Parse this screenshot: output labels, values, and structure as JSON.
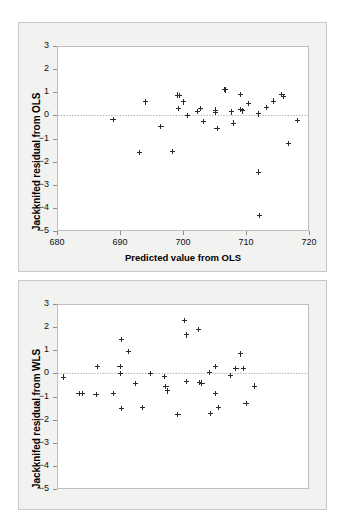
{
  "figure": {
    "background": "#ffffff",
    "panel_bg": "#f2f2f0",
    "marker_color": "#2a2a2a",
    "zero_line_color": "#9a9a9a"
  },
  "panels": [
    {
      "id": "ols",
      "ylabel": "Jackknifed residual from OLS",
      "xlabel": "Predicted value from OLS",
      "show_xaxis": true
    },
    {
      "id": "wls",
      "ylabel": "Jackknifed residual from WLS",
      "xlabel": "",
      "show_xaxis": false
    }
  ],
  "chart_data": [
    {
      "type": "scatter",
      "title": "",
      "xlabel": "Predicted value from OLS",
      "ylabel": "Jackknifed residual from OLS",
      "xlim": [
        680,
        720
      ],
      "ylim": [
        -5,
        3
      ],
      "xticks": [
        680,
        690,
        700,
        710,
        720
      ],
      "yticks": [
        3,
        2,
        1,
        0,
        -1,
        -2,
        -3,
        -4,
        -5
      ],
      "xtick_labels": [
        "680",
        "690",
        "700",
        "710",
        "720"
      ],
      "ytick_labels": [
        "3",
        "2",
        "1",
        "0",
        "−1",
        "−2",
        "−3",
        "−4",
        "−5"
      ],
      "grid": false,
      "legend": "none",
      "annotations": [
        {
          "type": "hline",
          "y": 0,
          "style": "dotted"
        }
      ],
      "marker": "plus",
      "points": [
        {
          "x": 688.9,
          "y": -0.17
        },
        {
          "x": 693.1,
          "y": -1.62
        },
        {
          "x": 694.1,
          "y": 0.58
        },
        {
          "x": 696.5,
          "y": -0.49
        },
        {
          "x": 698.3,
          "y": -1.57
        },
        {
          "x": 699.2,
          "y": 0.88
        },
        {
          "x": 699.5,
          "y": 0.85
        },
        {
          "x": 699.3,
          "y": 0.31
        },
        {
          "x": 700.1,
          "y": 0.58
        },
        {
          "x": 700.7,
          "y": 0.01
        },
        {
          "x": 702.3,
          "y": 0.16
        },
        {
          "x": 702.8,
          "y": 0.3
        },
        {
          "x": 703.2,
          "y": -0.25
        },
        {
          "x": 705.1,
          "y": 0.23
        },
        {
          "x": 705.2,
          "y": 0.12
        },
        {
          "x": 705.4,
          "y": -0.57
        },
        {
          "x": 706.6,
          "y": 1.11
        },
        {
          "x": 706.8,
          "y": 1.1
        },
        {
          "x": 707.7,
          "y": 0.15
        },
        {
          "x": 708.0,
          "y": -0.33
        },
        {
          "x": 709.1,
          "y": 0.92
        },
        {
          "x": 709.2,
          "y": 0.27
        },
        {
          "x": 709.5,
          "y": 0.19
        },
        {
          "x": 710.4,
          "y": 0.53
        },
        {
          "x": 712.0,
          "y": 0.06
        },
        {
          "x": 712.0,
          "y": -2.45
        },
        {
          "x": 712.2,
          "y": -4.33
        },
        {
          "x": 713.2,
          "y": 0.35
        },
        {
          "x": 714.4,
          "y": 0.62
        },
        {
          "x": 715.7,
          "y": 0.89
        },
        {
          "x": 716.0,
          "y": 0.83
        },
        {
          "x": 716.7,
          "y": -1.2
        },
        {
          "x": 718.2,
          "y": -0.22
        }
      ]
    },
    {
      "type": "scatter",
      "title": "",
      "xlabel": "",
      "ylabel": "Jackknifed residual from WLS",
      "xlim": [
        680,
        720
      ],
      "ylim": [
        -5,
        3
      ],
      "xticks": [],
      "yticks": [
        3,
        2,
        1,
        0,
        -1,
        -2,
        -3,
        -4,
        -5
      ],
      "xtick_labels": [],
      "ytick_labels": [
        "3",
        "2",
        "1",
        "0",
        "−1",
        "−2",
        "−3",
        "−4",
        "−5"
      ],
      "grid": false,
      "legend": "none",
      "annotations": [
        {
          "type": "hline",
          "y": 0,
          "style": "dotted"
        }
      ],
      "marker": "plus",
      "points": [
        {
          "x": 681.0,
          "y": -0.16
        },
        {
          "x": 683.5,
          "y": -0.88
        },
        {
          "x": 684.1,
          "y": -0.88
        },
        {
          "x": 686.2,
          "y": -0.9
        },
        {
          "x": 686.4,
          "y": 0.29
        },
        {
          "x": 689.0,
          "y": -0.88
        },
        {
          "x": 690.2,
          "y": 1.46
        },
        {
          "x": 690.0,
          "y": 0.3
        },
        {
          "x": 690.1,
          "y": 0.0
        },
        {
          "x": 690.3,
          "y": -1.53
        },
        {
          "x": 691.3,
          "y": 0.94
        },
        {
          "x": 692.4,
          "y": -0.45
        },
        {
          "x": 693.6,
          "y": -1.49
        },
        {
          "x": 694.8,
          "y": 0.01
        },
        {
          "x": 697.0,
          "y": -0.14
        },
        {
          "x": 697.3,
          "y": -0.58
        },
        {
          "x": 697.6,
          "y": -0.76
        },
        {
          "x": 699.2,
          "y": -1.78
        },
        {
          "x": 700.2,
          "y": 2.27
        },
        {
          "x": 700.5,
          "y": 1.66
        },
        {
          "x": 700.6,
          "y": -0.36
        },
        {
          "x": 702.4,
          "y": 1.91
        },
        {
          "x": 702.6,
          "y": -0.4
        },
        {
          "x": 703.0,
          "y": -0.42
        },
        {
          "x": 704.2,
          "y": 0.04
        },
        {
          "x": 704.4,
          "y": -1.72
        },
        {
          "x": 705.1,
          "y": 0.29
        },
        {
          "x": 705.2,
          "y": -0.86
        },
        {
          "x": 705.6,
          "y": -1.47
        },
        {
          "x": 707.5,
          "y": -0.08
        },
        {
          "x": 708.4,
          "y": 0.22
        },
        {
          "x": 709.1,
          "y": 0.84
        },
        {
          "x": 709.6,
          "y": 0.2
        },
        {
          "x": 710.0,
          "y": -1.3
        },
        {
          "x": 711.4,
          "y": -0.55
        }
      ]
    }
  ]
}
